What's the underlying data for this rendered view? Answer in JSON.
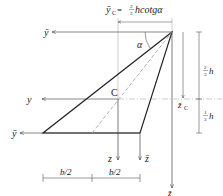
{
  "diagram": {
    "title_formula": {
      "lhs": "ȳ",
      "lhs_sub": "C",
      "equals": " = ",
      "frac_num": "2",
      "frac_den": "3",
      "rhs": "hcotgα"
    },
    "angle_label": "α",
    "centroid_label": "C",
    "axes": {
      "y_bar_top": "ȳ",
      "y": "y",
      "y_bar_bottom": "ȳ",
      "z": "z",
      "z_bar_small": "z̄",
      "z_bar_large": "z̄",
      "z_bar_c": "z̄",
      "z_bar_c_sub": "C"
    },
    "dimensions": {
      "two_thirds_num": "2",
      "two_thirds_den": "3",
      "two_thirds_var": "h",
      "one_third_num": "1",
      "one_third_den": "3",
      "one_third_var": "h",
      "b_half_left": "b/2",
      "b_half_right": "b/2"
    },
    "colors": {
      "line": "#222222",
      "axis": "#555555",
      "dashed": "#aaaaaa"
    }
  }
}
